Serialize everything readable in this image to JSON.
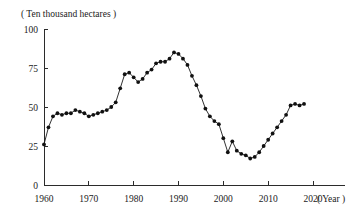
{
  "chart_data": {
    "type": "line",
    "title": "",
    "unit_label": "( Ten thousand hectares )",
    "xlabel": "( Year )",
    "ylabel": "",
    "xlim": [
      1960,
      2020
    ],
    "ylim": [
      0,
      100
    ],
    "grid": false,
    "legend": "none",
    "marker": "filled-circle",
    "y_ticks": [
      0,
      25,
      50,
      75,
      100
    ],
    "y_tick_labels": [
      "0",
      "25",
      "50",
      "75",
      "100"
    ],
    "x_ticks": [
      1960,
      1970,
      1980,
      1990,
      2000,
      2010,
      2020
    ],
    "x_tick_labels": [
      "1960",
      "1970",
      "1980",
      "1990",
      "2000",
      "2010",
      "2020"
    ],
    "x": [
      1960,
      1961,
      1962,
      1963,
      1964,
      1965,
      1966,
      1967,
      1968,
      1969,
      1970,
      1971,
      1972,
      1973,
      1974,
      1975,
      1976,
      1977,
      1978,
      1979,
      1980,
      1981,
      1982,
      1983,
      1984,
      1985,
      1986,
      1987,
      1988,
      1989,
      1990,
      1991,
      1992,
      1993,
      1994,
      1995,
      1996,
      1997,
      1998,
      1999,
      2000,
      2001,
      2002,
      2003,
      2004,
      2005,
      2006,
      2007,
      2008,
      2009,
      2010,
      2011,
      2012,
      2013,
      2014,
      2015,
      2016,
      2017,
      2018
    ],
    "values": [
      26,
      37,
      44,
      46,
      45,
      46,
      46,
      48,
      47,
      46,
      44,
      45,
      46,
      47,
      48,
      50,
      53,
      62,
      71,
      72,
      69,
      66,
      68,
      72,
      74,
      78,
      79,
      79,
      81,
      85,
      84,
      81,
      77,
      70,
      64,
      57,
      49,
      44,
      41,
      39,
      30,
      21,
      28,
      22,
      20,
      19,
      17,
      18,
      21,
      25,
      29,
      33,
      37,
      41,
      45,
      51,
      52,
      51,
      52
    ],
    "series": [
      {
        "name": "area",
        "values": [
          26,
          37,
          44,
          46,
          45,
          46,
          46,
          48,
          47,
          46,
          44,
          45,
          46,
          47,
          48,
          50,
          53,
          62,
          71,
          72,
          69,
          66,
          68,
          72,
          74,
          78,
          79,
          79,
          81,
          85,
          84,
          81,
          77,
          70,
          64,
          57,
          49,
          44,
          41,
          39,
          30,
          21,
          28,
          22,
          20,
          19,
          17,
          18,
          21,
          25,
          29,
          33,
          37,
          41,
          45,
          51,
          52,
          51,
          52
        ]
      }
    ],
    "annotations": []
  },
  "colors": {
    "line": "#1a1a1a",
    "marker": "#111111",
    "axis": "#2b2b2b",
    "background": "#ffffff"
  }
}
